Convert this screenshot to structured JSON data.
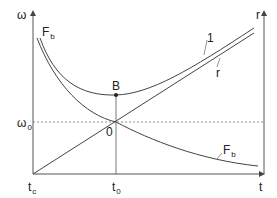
{
  "diagram": {
    "axes": {
      "left_axis_label": "ω",
      "right_axis_label": "r",
      "x_axis_label": "t",
      "omega0_label": "ω",
      "omega0_sub": "0",
      "tc_label": "t",
      "tc_sub": "c",
      "t0_label": "t",
      "t0_sub": "0"
    },
    "points": {
      "B_label": "B",
      "O_label": "0"
    },
    "curves": {
      "Fb_top_label": "F",
      "Fb_top_sub": "b",
      "Fb_bottom_label": "F",
      "Fb_bottom_sub": "b",
      "line1_label": "1",
      "line_r_label": "r"
    },
    "colors": {
      "stroke": "#444444",
      "dashed": "#777777",
      "text": "#222222"
    }
  }
}
